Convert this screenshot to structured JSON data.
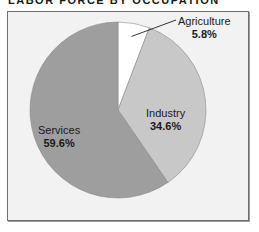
{
  "title": "LABOR FORCE BY OCCUPATION",
  "chart_data": {
    "type": "pie",
    "title": "LABOR FORCE BY OCCUPATION",
    "categories": [
      "Agriculture",
      "Industry",
      "Services"
    ],
    "values": [
      5.8,
      34.6,
      59.6
    ],
    "unit": "%",
    "colors": [
      "#ffffff",
      "#c8c8c8",
      "#9e9e9e"
    ],
    "labels": [
      {
        "name": "Agriculture",
        "value": "5.8%"
      },
      {
        "name": "Industry",
        "value": "34.6%"
      },
      {
        "name": "Services",
        "value": "59.6%"
      }
    ],
    "start_angle": "12 o'clock, clockwise",
    "legend": "none (direct labels)"
  }
}
